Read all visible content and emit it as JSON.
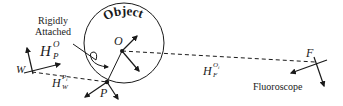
{
  "diagram": {
    "object_label": "Object",
    "rigid_label_line1": "Rigidly",
    "rigid_label_line2": "Attached",
    "fluoroscope_label": "Fluoroscope",
    "frames": {
      "W": "W",
      "P": "P",
      "O": "O",
      "F": "F"
    },
    "transforms": {
      "h_p_o": {
        "base": "H",
        "sub": "P",
        "sup": "O"
      },
      "h_w_pi": {
        "base": "H",
        "sub": "W",
        "sup": "P",
        "sup_sub": "i"
      },
      "h_f_oi": {
        "base": "H",
        "sub": "F",
        "sup": "O",
        "sup_sub": "i"
      }
    },
    "colors": {
      "ink": "#1a1a1a",
      "background": "#ffffff"
    }
  }
}
